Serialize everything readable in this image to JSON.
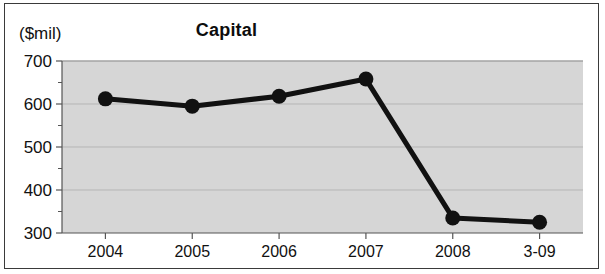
{
  "figure": {
    "title": "Capital",
    "y_axis_unit_label": "($mil)"
  },
  "chart_data": {
    "type": "line",
    "title": "Capital",
    "xlabel": "",
    "ylabel": "($mil)",
    "categories": [
      "2004",
      "2005",
      "2006",
      "2007",
      "2008",
      "3-09"
    ],
    "values": [
      612,
      595,
      618,
      658,
      335,
      325
    ],
    "series": [
      {
        "name": "Capital",
        "values": [
          612,
          595,
          618,
          658,
          335,
          325
        ]
      }
    ],
    "ylim": [
      300,
      700
    ],
    "yticks": [
      300,
      400,
      500,
      600,
      700
    ],
    "ytick_labels": [
      "300",
      "400",
      "500",
      "600",
      "700"
    ],
    "yminor_ticks": [
      350,
      450,
      550,
      650
    ],
    "grid": true,
    "legend": false,
    "marker": "filled-circle",
    "line_color": "#111111",
    "plot_background": "#d6d6d6",
    "gridline_color": "#b5b5b5"
  },
  "colors": {
    "frame": "#3a3a3a",
    "text": "#111111",
    "plot_bg": "#d6d6d6",
    "line": "#111111",
    "gridline": "#b6b6b6",
    "axis": "#555555"
  }
}
